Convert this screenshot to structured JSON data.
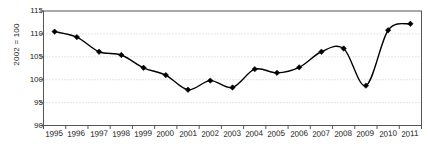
{
  "chart_data": {
    "type": "line",
    "title": "",
    "subtitle": "",
    "xlabel": "",
    "ylabel": "2002 = 100",
    "categories": [
      "1995",
      "1996",
      "1997",
      "1998",
      "1999",
      "2000",
      "2001",
      "2002",
      "2003",
      "2004",
      "2005",
      "2006",
      "2007",
      "2008",
      "2009",
      "2010",
      "2011"
    ],
    "values": [
      110.5,
      109.3,
      106.1,
      105.4,
      102.6,
      101.0,
      97.8,
      99.8,
      98.3,
      102.3,
      101.5,
      102.7,
      106.1,
      106.8,
      98.7,
      110.8,
      112.2
    ],
    "series": [
      {
        "name": "2002 = 100",
        "values": [
          110.5,
          109.3,
          106.1,
          105.4,
          102.6,
          101.0,
          97.8,
          99.8,
          98.3,
          102.3,
          101.5,
          102.7,
          106.1,
          106.8,
          98.7,
          110.8,
          112.2
        ]
      }
    ],
    "ylim": [
      90,
      115
    ],
    "yticks": [
      90,
      95,
      100,
      105,
      110,
      115
    ],
    "ytick_labels": [
      "90",
      "95",
      "100",
      "105",
      "110",
      "115"
    ],
    "grid": "horizontal-dotted",
    "legend": "none",
    "marker": "diamond",
    "line_color": "#000000",
    "marker_color": "#000000",
    "grid_color": "#cccccc",
    "axis_color": "#555555"
  }
}
